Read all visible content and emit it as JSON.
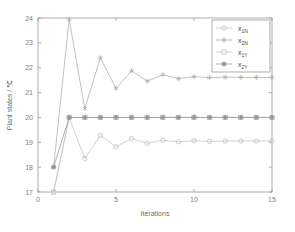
{
  "chart_data": {
    "type": "line",
    "title": "",
    "xlabel": "Iterations",
    "ylabel": "Plant states / ℃",
    "xlim": [
      0,
      15
    ],
    "ylim": [
      17,
      24
    ],
    "xticks": [
      0,
      5,
      10,
      15
    ],
    "yticks": [
      17,
      18,
      19,
      20,
      21,
      22,
      23,
      24
    ],
    "grid": false,
    "legend_position": "upper right",
    "x": [
      1,
      2,
      3,
      4,
      5,
      6,
      7,
      8,
      9,
      10,
      11,
      12,
      13,
      14,
      15
    ],
    "series": [
      {
        "name": "x_1N",
        "label_base": "x",
        "label_sub": "1N",
        "marker": "circle-open",
        "color": "#bdbdbd",
        "values": [
          17.0,
          20.0,
          18.35,
          19.28,
          18.82,
          19.15,
          18.96,
          19.08,
          19.02,
          19.06,
          19.04,
          19.05,
          19.05,
          19.05,
          19.05
        ]
      },
      {
        "name": "x_2N",
        "label_base": "x",
        "label_sub": "2N",
        "marker": "asterisk",
        "color": "#a8a8a8",
        "values": [
          18.0,
          23.95,
          20.36,
          22.4,
          21.17,
          21.87,
          21.46,
          21.72,
          21.56,
          21.64,
          21.6,
          21.62,
          21.61,
          21.61,
          21.61
        ]
      },
      {
        "name": "x_1Y",
        "label_base": "x",
        "label_sub": "1Y",
        "marker": "square-open",
        "color": "#c4c4c4",
        "values": [
          17.0,
          20.0,
          20.0,
          20.0,
          20.0,
          20.0,
          20.0,
          20.0,
          20.0,
          20.0,
          20.0,
          20.0,
          20.0,
          20.0,
          20.0
        ]
      },
      {
        "name": "x_2Y",
        "label_base": "x",
        "label_sub": "2Y",
        "marker": "hexagram",
        "color": "#8f8f8f",
        "values": [
          18.0,
          20.0,
          20.0,
          20.0,
          20.0,
          20.0,
          20.0,
          20.0,
          20.0,
          20.0,
          20.0,
          20.0,
          20.0,
          20.0,
          20.0
        ]
      }
    ]
  },
  "figure": {
    "background_color": "#ffffff",
    "axis_color": "#9a9a9a"
  }
}
